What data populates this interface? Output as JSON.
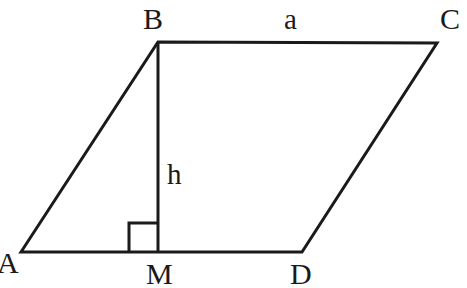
{
  "figure": {
    "kind": "geometry-diagram",
    "shape": "parallelogram",
    "background_color": "#ffffff",
    "stroke_color": "#1a1a1a",
    "label_color": "#1a1a1a",
    "stroke_width": 3,
    "canvas": {
      "width": 467,
      "height": 288
    }
  },
  "vertices": {
    "A": {
      "label": "A",
      "x": 21,
      "y": 252,
      "label_x": -3,
      "label_y": 248
    },
    "B": {
      "label": "B",
      "x": 158,
      "y": 42,
      "label_x": 143,
      "label_y": 4
    },
    "C": {
      "label": "C",
      "x": 437,
      "y": 43,
      "label_x": 440,
      "label_y": 4
    },
    "D": {
      "label": "D",
      "x": 302,
      "y": 252,
      "label_x": 290,
      "label_y": 259
    },
    "M": {
      "label": "M",
      "x": 158,
      "y": 252,
      "label_x": 146,
      "label_y": 259
    }
  },
  "segments": [
    {
      "name": "side-AB",
      "from": "A",
      "to": "B"
    },
    {
      "name": "side-BC",
      "from": "B",
      "to": "C"
    },
    {
      "name": "side-CD",
      "from": "C",
      "to": "D"
    },
    {
      "name": "side-DA",
      "from": "D",
      "to": "A"
    },
    {
      "name": "height-BM",
      "from": "B",
      "to": "M"
    }
  ],
  "measures": {
    "base": {
      "label": "a",
      "label_x": 284,
      "label_y": 5,
      "applies_to": "side-BC"
    },
    "height": {
      "label": "h",
      "label_x": 167,
      "label_y": 160,
      "applies_to": "height-BM"
    }
  },
  "right_angle": {
    "name": "right-angle-at-M",
    "vertex": "M",
    "size": 29,
    "x1": 129,
    "y1": 223,
    "x2": 158,
    "y2": 252
  }
}
